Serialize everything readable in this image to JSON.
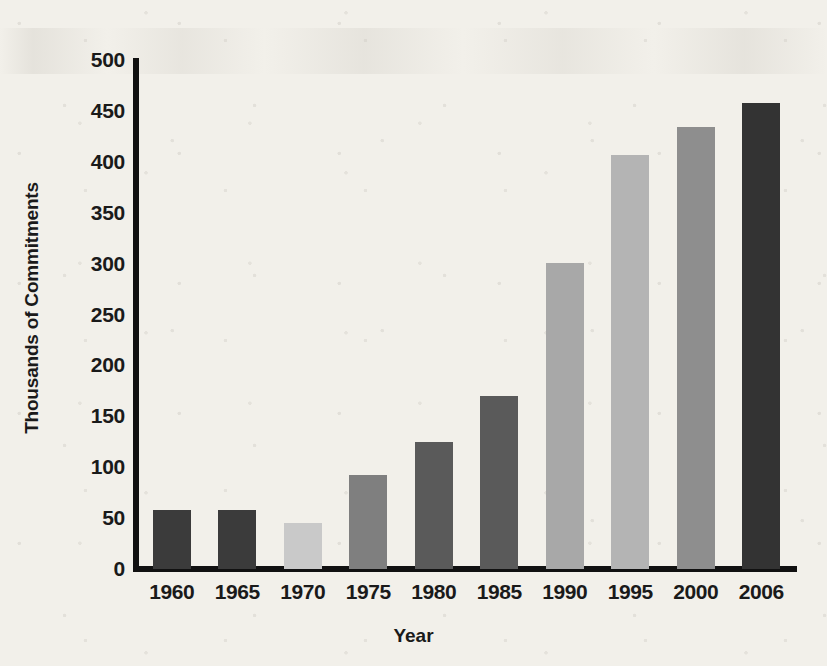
{
  "chart_data": {
    "type": "bar",
    "title": "",
    "xlabel": "Year",
    "ylabel": "Thousands of Commitments",
    "categories": [
      "1960",
      "1965",
      "1970",
      "1975",
      "1980",
      "1985",
      "1990",
      "1995",
      "2000",
      "2006"
    ],
    "values": [
      58,
      58,
      45,
      92,
      125,
      170,
      301,
      407,
      434,
      458
    ],
    "ylim": [
      0,
      500
    ],
    "ytick_labels": [
      "0",
      "50",
      "100",
      "150",
      "200",
      "250",
      "300",
      "350",
      "400",
      "450",
      "500"
    ],
    "ytick_values": [
      0,
      50,
      100,
      150,
      200,
      250,
      300,
      350,
      400,
      450,
      500
    ],
    "grid": false,
    "legend": "none",
    "bar_colors": [
      "#3b3b3b",
      "#3b3b3b",
      "#c9c9c9",
      "#7f7f7f",
      "#5a5a5a",
      "#5a5a5a",
      "#a8a8a8",
      "#b4b4b4",
      "#8e8e8e",
      "#333333"
    ],
    "axis_color": "#111111",
    "background_color": "#f2f0ea",
    "text_color": "#1a1a1a"
  }
}
